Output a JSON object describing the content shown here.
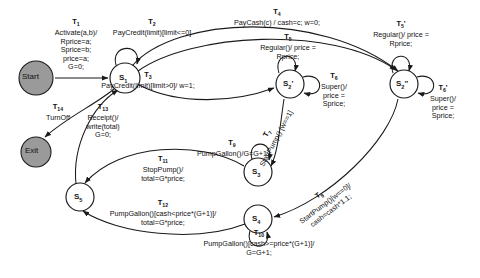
{
  "diagram": {
    "stroke": "#1a1a1a",
    "terminal_fill": "#9a9a9a",
    "state_fill": "#ffffff"
  },
  "terminals": [
    {
      "id": "start",
      "label": "Start",
      "cx": 36,
      "cy": 78,
      "r": 17
    },
    {
      "id": "exit",
      "label": "Exit",
      "cx": 36,
      "cy": 152,
      "r": 15
    }
  ],
  "states": [
    {
      "id": "s1",
      "label": "S",
      "sub": "1",
      "cx": 125,
      "cy": 78,
      "r": 15
    },
    {
      "id": "s2p",
      "label": "S",
      "sub": "2",
      "prime": "'",
      "cx": 290,
      "cy": 84,
      "r": 14
    },
    {
      "id": "s2pp",
      "label": "S",
      "sub": "2",
      "prime": "\"",
      "cx": 404,
      "cy": 84,
      "r": 14
    },
    {
      "id": "s3",
      "label": "S",
      "sub": "3",
      "cx": 258,
      "cy": 172,
      "r": 14
    },
    {
      "id": "s4",
      "label": "S",
      "sub": "4",
      "cx": 258,
      "cy": 219,
      "r": 14
    },
    {
      "id": "s5",
      "label": "S",
      "sub": "5",
      "cx": 80,
      "cy": 197,
      "r": 14
    }
  ],
  "transitions": [
    {
      "id": "T1",
      "name": "T",
      "sub": "1",
      "lines": [
        "Activate(a,b)/",
        "Rprice=a;",
        "Sprice=b;",
        "price=a;",
        "G=0;"
      ],
      "name_x": 76,
      "name_y": 18,
      "text_x": 76,
      "text_y": 27
    },
    {
      "id": "T2",
      "name": "T",
      "sub": "2",
      "lines": [
        "PayCredit(limit)[limit<=0]"
      ],
      "name_x": 152,
      "name_y": 18,
      "text_x": 152,
      "text_y": 27
    },
    {
      "id": "T3",
      "name": "T",
      "sub": "3",
      "lines": [
        "PayCredit(limit)[limit>0]/ w=1;"
      ],
      "name_x": 148,
      "name_y": 71,
      "text_x": 148,
      "text_y": 80
    },
    {
      "id": "T4",
      "name": "T",
      "sub": "4",
      "lines": [
        "PayCash(c) / cash=c;  w=0;"
      ],
      "name_x": 277,
      "name_y": 8,
      "text_x": 277,
      "text_y": 17
    },
    {
      "id": "T5",
      "name": "T",
      "sub": "5",
      "lines": [
        "Regular()/ price =",
        "Rprice;"
      ],
      "name_x": 288,
      "name_y": 33,
      "text_x": 288,
      "text_y": 42
    },
    {
      "id": "T5p",
      "name": "T",
      "sub": "5",
      "prime": "'",
      "lines": [
        "Regular()/ price =",
        "Rprice;"
      ],
      "name_x": 401,
      "name_y": 20,
      "text_x": 401,
      "text_y": 29
    },
    {
      "id": "T6",
      "name": "T",
      "sub": "6",
      "lines": [
        "Super()/",
        "price =",
        "Sprice;"
      ],
      "name_x": 334,
      "name_y": 72,
      "text_x": 334,
      "text_y": 81
    },
    {
      "id": "T6p",
      "name": "T",
      "sub": "6",
      "prime": "'",
      "lines": [
        "Super()/",
        "price =",
        "Sprice;"
      ],
      "name_x": 443,
      "name_y": 84,
      "text_x": 443,
      "text_y": 93
    },
    {
      "id": "T7",
      "name": "T",
      "sub": "7",
      "lines": [
        "StartPump() [w==1]"
      ],
      "name_x": 272,
      "name_y": 136,
      "rot": -62
    },
    {
      "id": "T8",
      "name": "T",
      "sub": "8",
      "lines": [
        "StartPump()[w==0]/",
        "cash=cash*1.1;"
      ],
      "name_x": 325,
      "name_y": 203,
      "rot": -37
    },
    {
      "id": "T9",
      "name": "T",
      "sub": "9",
      "lines": [
        "PumpGallon()/G=G+1"
      ],
      "name_x": 232,
      "name_y": 139,
      "text_x": 232,
      "text_y": 148
    },
    {
      "id": "T10",
      "name": "T",
      "sub": "10",
      "lines": [
        "PumpGallon()[cash>=price*(G+1)]/",
        "G=G+1;"
      ],
      "name_x": 259,
      "name_y": 229,
      "text_x": 259,
      "text_y": 238
    },
    {
      "id": "T11",
      "name": "T",
      "sub": "11",
      "lines": [
        "StopPump()/",
        "total=G*price;"
      ],
      "name_x": 163,
      "name_y": 155,
      "text_x": 163,
      "text_y": 164
    },
    {
      "id": "T12",
      "name": "T",
      "sub": "12",
      "lines": [
        "PumpGallon()[cash<price*(G+1)]/",
        "total=G*price;"
      ],
      "name_x": 163,
      "name_y": 199,
      "text_x": 163,
      "text_y": 208
    },
    {
      "id": "T13",
      "name": "T",
      "sub": "13",
      "lines": [
        "Receipt()/",
        "write(total)",
        "G=0;"
      ],
      "name_x": 103,
      "name_y": 103,
      "text_x": 103,
      "text_y": 112
    },
    {
      "id": "T14",
      "name": "T",
      "sub": "14",
      "lines": [
        "TurnOff"
      ],
      "name_x": 58,
      "name_y": 103,
      "text_x": 58,
      "text_y": 112
    }
  ]
}
